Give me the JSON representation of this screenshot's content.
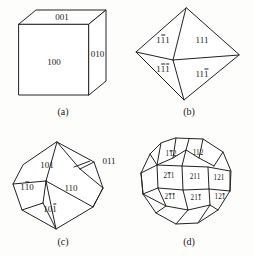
{
  "figure": {
    "background_color": "#fdfdfb",
    "line_color": "#222222",
    "text_color": "#1a1a1a",
    "panels": [
      {
        "id": "a",
        "caption": "(a)",
        "form_name": "cube",
        "labels": [
          {
            "text": "001",
            "bar_positions": []
          },
          {
            "text": "010",
            "bar_positions": []
          },
          {
            "text": "100",
            "bar_positions": []
          }
        ]
      },
      {
        "id": "b",
        "caption": "(b)",
        "form_name": "octahedron",
        "labels": [
          {
            "text": "1̢1",
            "bar_positions": [
              1
            ]
          },
          {
            "text": "111",
            "bar_positions": []
          },
          {
            "text": "111",
            "bar_positions": [
              1,
              2
            ]
          },
          {
            "text": "111",
            "bar_positions": [
              2
            ]
          }
        ]
      },
      {
        "id": "c",
        "caption": "(c)",
        "form_name": "rhombic-dodecahedron",
        "labels": [
          {
            "text": "101",
            "bar_positions": []
          },
          {
            "text": "011",
            "bar_positions": []
          },
          {
            "text": "110",
            "bar_positions": [
              1
            ]
          },
          {
            "text": "110",
            "bar_positions": []
          },
          {
            "text": "101",
            "bar_positions": [
              2
            ]
          }
        ]
      },
      {
        "id": "d",
        "caption": "(d)",
        "form_name": "trapezohedron",
        "labels": [
          {
            "text": "112",
            "bar_positions": [
              1
            ]
          },
          {
            "text": "112",
            "bar_positions": []
          },
          {
            "text": "211",
            "bar_positions": [
              1
            ]
          },
          {
            "text": "211",
            "bar_positions": []
          },
          {
            "text": "121",
            "bar_positions": []
          },
          {
            "text": "211",
            "bar_positions": [
              1,
              2
            ]
          },
          {
            "text": "211",
            "bar_positions": [
              2
            ]
          },
          {
            "text": "121",
            "bar_positions": [
              2
            ]
          }
        ]
      }
    ]
  },
  "panel_a": {
    "caption": "(a)",
    "label_top": "001",
    "label_right": "010",
    "label_front": "100"
  },
  "panel_b": {
    "caption": "(b)",
    "label_upper_left_1": "1",
    "label_upper_left_2": "1",
    "label_upper_left_3": "1",
    "label_upper_right": "111",
    "label_lower_left_1": "1",
    "label_lower_left_2": "1",
    "label_lower_left_3": "1",
    "label_lower_right_1": "11",
    "label_lower_right_2": "1"
  },
  "panel_c": {
    "caption": "(c)",
    "label_101": "101",
    "label_011": "011",
    "label_1bar10_a": "1",
    "label_1bar10_b": "1",
    "label_1bar10_c": "0",
    "label_110": "110",
    "label_10bar1_a": "10",
    "label_10bar1_b": "1"
  },
  "panel_d": {
    "caption": "(d)",
    "l_1b12_a": "1",
    "l_1b12_b": "1",
    "l_1b12_c": "2",
    "l_112": "112",
    "l_2b11_a": "2",
    "l_2b11_b": "1",
    "l_2b11_c": "1",
    "l_211": "211",
    "l_121": "121",
    "l_2b1b1_a": "2",
    "l_2b1b1_b": "1",
    "l_2b1b1_c": "1",
    "l_21b1_a": "21",
    "l_21b1_b": "1",
    "l_12b1_a": "12",
    "l_12b1_b": "1"
  }
}
